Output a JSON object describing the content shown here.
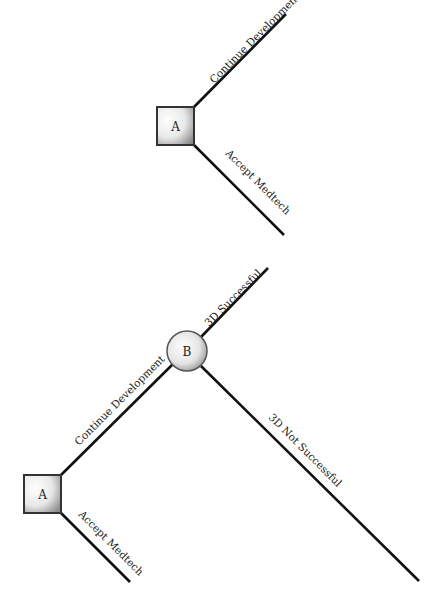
{
  "diagram": {
    "type": "decision-tree",
    "trees": [
      {
        "id": "tree-1",
        "nodes": [
          {
            "id": "A",
            "kind": "decision",
            "label": "A"
          }
        ],
        "branches": [
          {
            "from": "A",
            "label": "Continue Development"
          },
          {
            "from": "A",
            "label": "Accept Medtech"
          }
        ]
      },
      {
        "id": "tree-2",
        "nodes": [
          {
            "id": "A",
            "kind": "decision",
            "label": "A"
          },
          {
            "id": "B",
            "kind": "chance",
            "label": "B"
          }
        ],
        "branches": [
          {
            "from": "A",
            "to": "B",
            "label": "Continue Development"
          },
          {
            "from": "A",
            "label": "Accept Medtech"
          },
          {
            "from": "B",
            "label": "3D Successful"
          },
          {
            "from": "B",
            "label": "3D Not Successful"
          }
        ]
      }
    ]
  },
  "labels": {
    "top_node_a": "A",
    "top_continue": "Continue Development",
    "top_accept": "Accept Medtech",
    "bottom_node_a": "A",
    "bottom_node_b": "B",
    "bottom_continue": "Continue Development",
    "bottom_accept": "Accept Medtech",
    "success": "3D Successful",
    "not_success": "3D Not Successful"
  }
}
